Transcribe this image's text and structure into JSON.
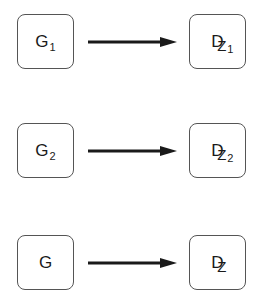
{
  "diagram": {
    "rows": [
      {
        "source": {
          "main": "G",
          "sub": "1"
        },
        "target": {
          "main": "D",
          "z": "Z",
          "sub": "1"
        }
      },
      {
        "source": {
          "main": "G",
          "sub": "2"
        },
        "target": {
          "main": "D",
          "z": "Z",
          "sub": "2"
        }
      },
      {
        "source": {
          "main": "G",
          "sub": ""
        },
        "target": {
          "main": "D",
          "z": "Z",
          "sub": ""
        }
      }
    ],
    "colors": {
      "border": "#555555",
      "arrow": "#1a1a1a",
      "text": "#1a1a1a"
    }
  }
}
